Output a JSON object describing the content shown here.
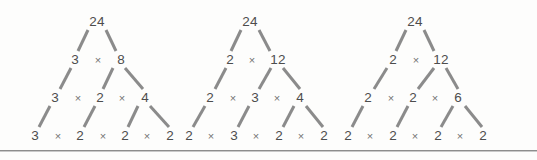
{
  "figure": {
    "background_color": "#fdfdfc",
    "node_text_color": "#4d4d4d",
    "operator_color": "#737373",
    "edge_color": "#8b8b8b",
    "divider_color": "#8d8d8d",
    "operator_symbol": "×"
  },
  "trees": [
    {
      "name": "factor-tree-1",
      "root": "24",
      "rows": [
        {
          "nodes": [
            "24"
          ]
        },
        {
          "nodes": [
            "3",
            "8"
          ]
        },
        {
          "nodes": [
            "3",
            "2",
            "4"
          ]
        },
        {
          "nodes": [
            "3",
            "2",
            "2",
            "2"
          ]
        }
      ],
      "factorization": "3 × 2 × 2 × 2"
    },
    {
      "name": "factor-tree-2",
      "root": "24",
      "rows": [
        {
          "nodes": [
            "24"
          ]
        },
        {
          "nodes": [
            "2",
            "12"
          ]
        },
        {
          "nodes": [
            "2",
            "3",
            "4"
          ]
        },
        {
          "nodes": [
            "2",
            "3",
            "2",
            "2"
          ]
        }
      ],
      "factorization": "2 × 3 × 2 × 2"
    },
    {
      "name": "factor-tree-3",
      "root": "24",
      "rows": [
        {
          "nodes": [
            "24"
          ]
        },
        {
          "nodes": [
            "2",
            "12"
          ]
        },
        {
          "nodes": [
            "2",
            "2",
            "6"
          ]
        },
        {
          "nodes": [
            "2",
            "2",
            "2",
            "2"
          ]
        }
      ],
      "factorization": "2 × 2 × 2 × 2"
    }
  ],
  "operators": {
    "t1r2": [
      "×"
    ],
    "t1r3": [
      "×",
      "×"
    ],
    "t1r4": [
      "×",
      "×",
      "×"
    ],
    "t2r2": [
      "×"
    ],
    "t2r3": [
      "×",
      "×"
    ],
    "t2r4": [
      "×",
      "×",
      "×"
    ],
    "t3r2": [
      "×"
    ],
    "t3r3": [
      "×",
      "×"
    ],
    "t3r4": [
      "×",
      "×",
      "×"
    ]
  }
}
